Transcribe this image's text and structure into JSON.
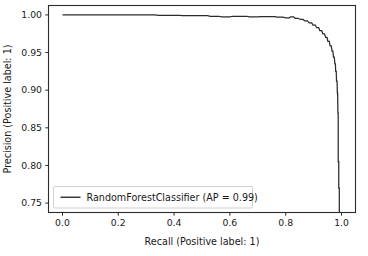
{
  "chart_data": {
    "type": "line",
    "title": "",
    "xlabel": "Recall (Positive label: 1)",
    "ylabel": "Precision (Positive label: 1)",
    "xlim": [
      -0.05,
      1.05
    ],
    "ylim": [
      0.7375,
      1.0125
    ],
    "grid": false,
    "legend_position": "lower left",
    "xticks": [
      0.0,
      0.2,
      0.4,
      0.6,
      0.8,
      1.0
    ],
    "xtick_labels": [
      "0.0",
      "0.2",
      "0.4",
      "0.6",
      "0.8",
      "1.0"
    ],
    "yticks": [
      0.75,
      0.8,
      0.85,
      0.9,
      0.95,
      1.0
    ],
    "ytick_labels": [
      "0.75",
      "0.80",
      "0.85",
      "0.90",
      "0.95",
      "1.00"
    ],
    "series": [
      {
        "name": "RandomForestClassifier (AP = 0.99)",
        "color": "#2b2b2b",
        "points": [
          [
            0.0,
            1.0
          ],
          [
            0.33,
            1.0
          ],
          [
            0.345,
            0.9995
          ],
          [
            0.42,
            0.9995
          ],
          [
            0.43,
            0.999
          ],
          [
            0.52,
            0.999
          ],
          [
            0.53,
            0.9982
          ],
          [
            0.56,
            0.9982
          ],
          [
            0.57,
            0.9975
          ],
          [
            0.6,
            0.9975
          ],
          [
            0.61,
            0.9982
          ],
          [
            0.66,
            0.9982
          ],
          [
            0.67,
            0.9975
          ],
          [
            0.7,
            0.9975
          ],
          [
            0.71,
            0.9978
          ],
          [
            0.76,
            0.9978
          ],
          [
            0.77,
            0.997
          ],
          [
            0.79,
            0.997
          ],
          [
            0.8,
            0.9962
          ],
          [
            0.812,
            0.9962
          ],
          [
            0.818,
            0.9975
          ],
          [
            0.828,
            0.9975
          ],
          [
            0.834,
            0.9955
          ],
          [
            0.845,
            0.9955
          ],
          [
            0.852,
            0.994
          ],
          [
            0.862,
            0.994
          ],
          [
            0.868,
            0.992
          ],
          [
            0.878,
            0.992
          ],
          [
            0.884,
            0.9895
          ],
          [
            0.893,
            0.9895
          ],
          [
            0.898,
            0.9865
          ],
          [
            0.906,
            0.9865
          ],
          [
            0.911,
            0.983
          ],
          [
            0.918,
            0.983
          ],
          [
            0.922,
            0.979
          ],
          [
            0.929,
            0.979
          ],
          [
            0.933,
            0.9748
          ],
          [
            0.939,
            0.9748
          ],
          [
            0.943,
            0.97
          ],
          [
            0.948,
            0.97
          ],
          [
            0.951,
            0.965
          ],
          [
            0.956,
            0.965
          ],
          [
            0.959,
            0.959
          ],
          [
            0.963,
            0.959
          ],
          [
            0.966,
            0.952
          ],
          [
            0.969,
            0.952
          ],
          [
            0.971,
            0.944
          ],
          [
            0.974,
            0.944
          ],
          [
            0.976,
            0.935
          ],
          [
            0.978,
            0.935
          ],
          [
            0.979,
            0.925
          ],
          [
            0.981,
            0.925
          ],
          [
            0.982,
            0.912
          ],
          [
            0.984,
            0.912
          ],
          [
            0.985,
            0.896
          ],
          [
            0.986,
            0.896
          ],
          [
            0.987,
            0.87
          ],
          [
            0.988,
            0.87
          ],
          [
            0.988,
            0.805
          ],
          [
            0.99,
            0.805
          ],
          [
            0.99,
            0.77
          ],
          [
            0.992,
            0.77
          ],
          [
            0.992,
            0.738
          ]
        ]
      }
    ]
  },
  "legend": {
    "entries": [
      {
        "label": "RandomForestClassifier (AP = 0.99)"
      }
    ]
  }
}
